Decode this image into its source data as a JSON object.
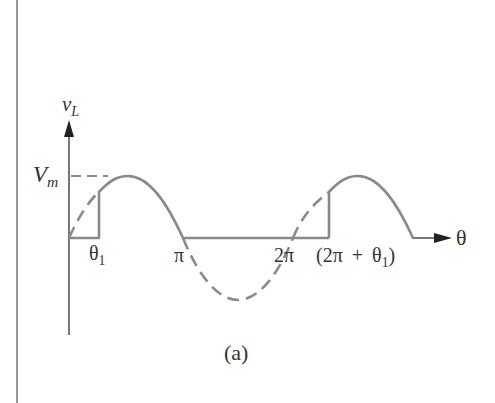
{
  "figure": {
    "caption": "(a)",
    "y_axis_label": {
      "main": "v",
      "sub": "L"
    },
    "x_axis_label": "θ",
    "amplitude_label": {
      "main": "V",
      "sub": "m"
    },
    "tick_labels": [
      {
        "main": "θ",
        "sub": "1"
      },
      {
        "main": "π"
      },
      {
        "main": "2π"
      },
      {
        "main": "(2π + θ",
        "sub": "1",
        "tail": ")"
      }
    ],
    "colors": {
      "curve": "#8a8a8a",
      "axis": "#555555",
      "text": "#333333",
      "border": "#9a9a9a"
    }
  }
}
